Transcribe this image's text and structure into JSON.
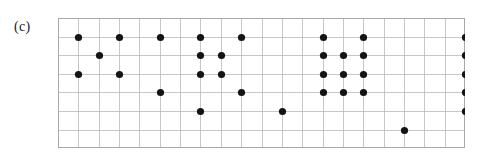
{
  "figure": {
    "panel_label": "(c)",
    "caption_text": "",
    "background_color": "#ffffff"
  },
  "lattice": {
    "columns": 20,
    "rows": 7,
    "cell_width": 20.35,
    "cell_height": 18.6,
    "origin_x": 0,
    "origin_y": 0,
    "grid_color": "#b9b9b9",
    "border_color": "#a8a8a8",
    "dot_color": "#141414",
    "dot_radius": 3.6,
    "row_labels": [
      "1",
      "2",
      "3",
      "4",
      "5",
      "6"
    ],
    "column_labels": [
      "1",
      "2",
      "3",
      "4",
      "5",
      "6",
      "7",
      "8",
      "9",
      "10",
      "11",
      "12",
      "13",
      "14",
      "15",
      "16",
      "17",
      "18",
      "19",
      "20"
    ]
  },
  "chart_data": {
    "type": "scatter",
    "title": "",
    "xlabel": "",
    "ylabel": "",
    "grid": true,
    "legend": "none",
    "xlim": [
      0,
      20
    ],
    "ylim": [
      0,
      7
    ],
    "points_by_row": [
      {
        "row": 1,
        "columns": [
          1,
          3,
          5,
          7,
          9,
          13,
          15,
          20
        ]
      },
      {
        "row": 2,
        "columns": [
          2,
          7,
          8,
          13,
          14,
          15,
          20,
          21,
          22,
          23
        ]
      },
      {
        "row": 3,
        "columns": [
          1,
          3,
          7,
          8,
          13,
          14,
          15,
          20,
          21,
          22,
          23
        ]
      },
      {
        "row": 4,
        "columns": [
          5,
          9,
          13,
          14,
          15,
          20,
          21,
          22,
          23
        ]
      },
      {
        "row": 5,
        "columns": [
          7,
          11,
          20,
          21,
          22,
          23
        ]
      },
      {
        "row": 6,
        "columns": [
          17,
          23
        ]
      }
    ],
    "total_points": 50
  }
}
